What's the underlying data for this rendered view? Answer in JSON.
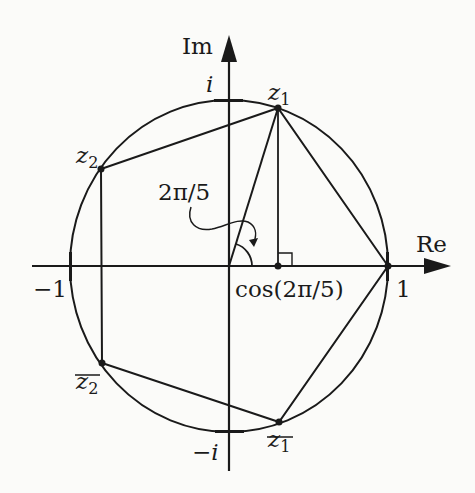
{
  "figure": {
    "axes": {
      "real_label": "Re",
      "imag_label": "Im"
    },
    "axis_marks": {
      "one": "1",
      "minus_one": "−1",
      "i": "i",
      "minus_i": "−i"
    },
    "points": {
      "z1": {
        "base": "z",
        "sub": "1",
        "conjugate": false
      },
      "z2": {
        "base": "z",
        "sub": "2",
        "conjugate": false
      },
      "z1bar": {
        "base": "z",
        "sub": "1",
        "conjugate": true
      },
      "z2bar": {
        "base": "z",
        "sub": "2",
        "conjugate": true
      }
    },
    "angle_label": "2π/5",
    "foot_label": "cos(2π/5)",
    "colors": {
      "ink": "#1a1a1a",
      "paper": "#fbfbf9"
    }
  }
}
